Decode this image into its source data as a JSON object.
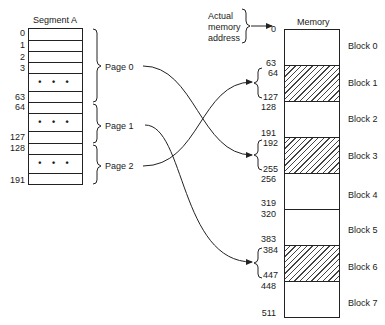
{
  "segment": {
    "title": "Segment A",
    "rows": [
      {
        "label": "0",
        "top": 0,
        "height": 12
      },
      {
        "label": "1",
        "top": 12,
        "height": 11
      },
      {
        "label": "2",
        "top": 23,
        "height": 11
      },
      {
        "label": "3",
        "top": 34,
        "height": 11
      },
      {
        "label": "",
        "top": 45,
        "height": 18,
        "dots": "• • •"
      },
      {
        "label": "63",
        "top": 63,
        "height": 11
      },
      {
        "label": "64",
        "top": 74,
        "height": 11
      },
      {
        "label": "",
        "top": 85,
        "height": 18,
        "dots": "• • •"
      },
      {
        "label": "127",
        "top": 103,
        "height": 12
      },
      {
        "label": "128",
        "top": 115,
        "height": 11
      },
      {
        "label": "",
        "top": 126,
        "height": 19,
        "dots": "• • •"
      },
      {
        "label": "191",
        "top": 145,
        "height": 12
      }
    ],
    "pages": [
      {
        "label": "Page 0",
        "maps_to_block": "Block 1"
      },
      {
        "label": "Page 1",
        "maps_to_block": "Block 6"
      },
      {
        "label": "Page 2",
        "maps_to_block": "Block 3"
      }
    ],
    "dots": "• • •"
  },
  "memory": {
    "title": "Memory",
    "address_caption": [
      "Actual",
      "memory",
      "address"
    ],
    "blocks": [
      {
        "label": "Block 0",
        "start": "0",
        "end": "63",
        "hatched": false
      },
      {
        "label": "Block 1",
        "start": "64",
        "end": "127",
        "hatched": true
      },
      {
        "label": "Block 2",
        "start": "128",
        "end": "191",
        "hatched": false
      },
      {
        "label": "Block 3",
        "start": "192",
        "end": "255",
        "hatched": true
      },
      {
        "label": "Block 4",
        "start": "256",
        "end": "319",
        "hatched": false
      },
      {
        "label": "Block 5",
        "start": "320",
        "end": "383",
        "hatched": false
      },
      {
        "label": "Block 6",
        "start": "384",
        "end": "447",
        "hatched": true
      },
      {
        "label": "Block 7",
        "start": "448",
        "end": "511",
        "hatched": false
      }
    ]
  },
  "colors": {
    "line": "#222222",
    "background": "#ffffff"
  }
}
